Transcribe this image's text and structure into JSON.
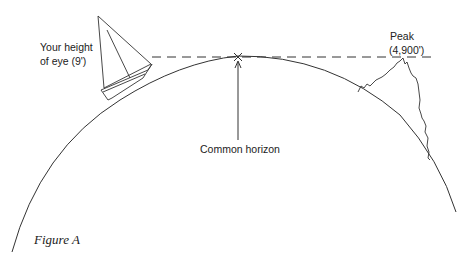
{
  "figure": {
    "caption": "Figure A",
    "labels": {
      "observer_line1": "Your height",
      "observer_line2": "of eye (9')",
      "horizon": "Common horizon",
      "peak_line1": "Peak",
      "peak_line2": "(4,900')"
    },
    "colors": {
      "line": "#333333",
      "background": "#ffffff"
    }
  }
}
